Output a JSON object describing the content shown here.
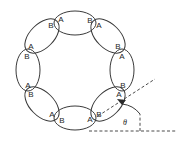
{
  "figure": {
    "kind": "ring-of-dimers-diagram",
    "background_color": "#ffffff",
    "outline_color": "#3a3a3a",
    "label_color": "#262626",
    "guide_color": "#4a4a4a"
  },
  "ring": {
    "center_x": 75,
    "center_y": 70,
    "radius": 47,
    "unit_count": 8,
    "unit_semi_major": 21,
    "unit_semi_minor": 12,
    "units": [
      {
        "position": "top",
        "angle_deg": 90,
        "cx": 75,
        "cy": 23,
        "rotation_deg": 0,
        "labels": [
          {
            "text": "A",
            "end": "start",
            "x": 61,
            "y": 20
          },
          {
            "text": "B",
            "end": "end",
            "x": 90,
            "y": 21
          }
        ]
      },
      {
        "position": "upper-right",
        "angle_deg": 45,
        "cx": 108,
        "cy": 36,
        "rotation_deg": 45,
        "labels": [
          {
            "text": "A",
            "end": "start",
            "x": 99,
            "y": 26
          },
          {
            "text": "B",
            "end": "end",
            "x": 118,
            "y": 47
          }
        ]
      },
      {
        "position": "right",
        "angle_deg": 0,
        "cx": 122,
        "cy": 70,
        "rotation_deg": 90,
        "labels": [
          {
            "text": "A",
            "end": "start",
            "x": 122,
            "y": 57
          },
          {
            "text": "B",
            "end": "end",
            "x": 123,
            "y": 86
          }
        ]
      },
      {
        "position": "lower-right",
        "angle_deg": 315,
        "cx": 108,
        "cy": 104,
        "rotation_deg": 135,
        "labels": [
          {
            "text": "A",
            "end": "start",
            "x": 119,
            "y": 95
          },
          {
            "text": "B",
            "end": "end",
            "x": 99,
            "y": 115
          }
        ]
      },
      {
        "position": "bottom",
        "angle_deg": 270,
        "cx": 75,
        "cy": 118,
        "rotation_deg": 0,
        "labels": [
          {
            "text": "B",
            "end": "start",
            "x": 62,
            "y": 121
          },
          {
            "text": "A",
            "end": "end",
            "x": 90,
            "y": 120
          }
        ]
      },
      {
        "position": "lower-left",
        "angle_deg": 225,
        "cx": 42,
        "cy": 104,
        "rotation_deg": 45,
        "labels": [
          {
            "text": "B",
            "end": "start",
            "x": 31,
            "y": 95
          },
          {
            "text": "A",
            "end": "end",
            "x": 52,
            "y": 115
          }
        ]
      },
      {
        "position": "left",
        "angle_deg": 180,
        "cx": 28,
        "cy": 70,
        "rotation_deg": 90,
        "labels": [
          {
            "text": "B",
            "end": "start",
            "x": 27,
            "y": 57
          },
          {
            "text": "A",
            "end": "end",
            "x": 28,
            "y": 86
          }
        ]
      },
      {
        "position": "upper-left",
        "angle_deg": 135,
        "cx": 42,
        "cy": 36,
        "rotation_deg": 135,
        "labels": [
          {
            "text": "B",
            "end": "start",
            "x": 51,
            "y": 26
          },
          {
            "text": "A",
            "end": "end",
            "x": 31,
            "y": 47
          }
        ]
      }
    ]
  },
  "annotation": {
    "angle_symbol": "θ",
    "angle_label_x": 125,
    "angle_label_y": 123,
    "vertex_x": 122,
    "vertex_y": 104,
    "tilt_guide": {
      "x1": 98,
      "y1": 116,
      "x2": 155,
      "y2": 79
    },
    "horizontal_guide": {
      "x1": 89,
      "y1": 131,
      "x2": 176,
      "y2": 131
    },
    "vertical_guide": {
      "x1": 140,
      "y1": 131,
      "x2": 140,
      "y2": 114
    },
    "arc_radius": 26
  }
}
